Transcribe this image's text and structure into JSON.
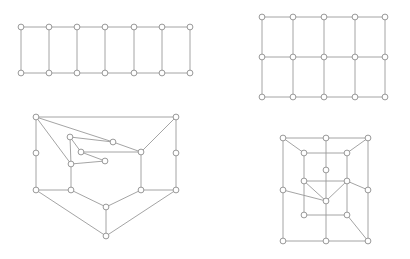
{
  "figure": {
    "background_color": "#ffffff",
    "edge_color": "#9a9a9a",
    "node_stroke_color": "#8d8d8d",
    "node_fill_color": "#ffffff",
    "node_radius": 2.9,
    "edge_width": 0.9,
    "width": 410,
    "height": 259,
    "panels": [
      {
        "id": "top-left",
        "name": "ladder-graph",
        "label": "Ladder graph P7 x K2",
        "node_count": 14,
        "edge_count": 19,
        "nodes": [
          {
            "id": 0,
            "x": 21,
            "y": 27
          },
          {
            "id": 1,
            "x": 49,
            "y": 27
          },
          {
            "id": 2,
            "x": 77,
            "y": 27
          },
          {
            "id": 3,
            "x": 105,
            "y": 27
          },
          {
            "id": 4,
            "x": 134,
            "y": 27
          },
          {
            "id": 5,
            "x": 162,
            "y": 27
          },
          {
            "id": 6,
            "x": 190,
            "y": 27
          },
          {
            "id": 7,
            "x": 21,
            "y": 73
          },
          {
            "id": 8,
            "x": 49,
            "y": 73
          },
          {
            "id": 9,
            "x": 77,
            "y": 73
          },
          {
            "id": 10,
            "x": 105,
            "y": 73
          },
          {
            "id": 11,
            "x": 134,
            "y": 73
          },
          {
            "id": 12,
            "x": 162,
            "y": 73
          },
          {
            "id": 13,
            "x": 190,
            "y": 73
          }
        ],
        "edges": [
          [
            0,
            1
          ],
          [
            1,
            2
          ],
          [
            2,
            3
          ],
          [
            3,
            4
          ],
          [
            4,
            5
          ],
          [
            5,
            6
          ],
          [
            7,
            8
          ],
          [
            8,
            9
          ],
          [
            9,
            10
          ],
          [
            10,
            11
          ],
          [
            11,
            12
          ],
          [
            12,
            13
          ],
          [
            0,
            7
          ],
          [
            1,
            8
          ],
          [
            2,
            9
          ],
          [
            3,
            10
          ],
          [
            4,
            11
          ],
          [
            5,
            12
          ],
          [
            6,
            13
          ]
        ]
      },
      {
        "id": "top-right",
        "name": "grid-graph",
        "label": "Grid graph P5 x P3",
        "node_count": 15,
        "edge_count": 22,
        "nodes": [
          {
            "id": 0,
            "x": 262,
            "y": 17
          },
          {
            "id": 1,
            "x": 293,
            "y": 17
          },
          {
            "id": 2,
            "x": 324,
            "y": 17
          },
          {
            "id": 3,
            "x": 355,
            "y": 17
          },
          {
            "id": 4,
            "x": 385,
            "y": 17
          },
          {
            "id": 5,
            "x": 262,
            "y": 57
          },
          {
            "id": 6,
            "x": 293,
            "y": 57
          },
          {
            "id": 7,
            "x": 324,
            "y": 57
          },
          {
            "id": 8,
            "x": 355,
            "y": 57
          },
          {
            "id": 9,
            "x": 385,
            "y": 57
          },
          {
            "id": 10,
            "x": 262,
            "y": 97
          },
          {
            "id": 11,
            "x": 293,
            "y": 97
          },
          {
            "id": 12,
            "x": 324,
            "y": 97
          },
          {
            "id": 13,
            "x": 355,
            "y": 97
          },
          {
            "id": 14,
            "x": 385,
            "y": 97
          }
        ],
        "edges": [
          [
            0,
            1
          ],
          [
            1,
            2
          ],
          [
            2,
            3
          ],
          [
            3,
            4
          ],
          [
            5,
            6
          ],
          [
            6,
            7
          ],
          [
            7,
            8
          ],
          [
            8,
            9
          ],
          [
            10,
            11
          ],
          [
            11,
            12
          ],
          [
            12,
            13
          ],
          [
            13,
            14
          ],
          [
            0,
            5
          ],
          [
            5,
            10
          ],
          [
            1,
            6
          ],
          [
            6,
            11
          ],
          [
            2,
            7
          ],
          [
            7,
            12
          ],
          [
            3,
            8
          ],
          [
            8,
            13
          ],
          [
            4,
            9
          ],
          [
            9,
            14
          ]
        ]
      },
      {
        "id": "bottom-left",
        "name": "planar-cubic-graph",
        "label": "Planar cubic graph drawing",
        "node_count": 16,
        "edge_count": 24,
        "nodes": [
          {
            "id": 0,
            "x": 36,
            "y": 117
          },
          {
            "id": 1,
            "x": 176,
            "y": 117
          },
          {
            "id": 2,
            "x": 70,
            "y": 137
          },
          {
            "id": 3,
            "x": 113,
            "y": 142
          },
          {
            "id": 4,
            "x": 81,
            "y": 152
          },
          {
            "id": 5,
            "x": 141,
            "y": 152
          },
          {
            "id": 6,
            "x": 71,
            "y": 164
          },
          {
            "id": 7,
            "x": 105,
            "y": 161
          },
          {
            "id": 8,
            "x": 36,
            "y": 190
          },
          {
            "id": 9,
            "x": 71,
            "y": 190
          },
          {
            "id": 10,
            "x": 141,
            "y": 190
          },
          {
            "id": 11,
            "x": 176,
            "y": 190
          },
          {
            "id": 12,
            "x": 106,
            "y": 207
          },
          {
            "id": 13,
            "x": 106,
            "y": 236
          },
          {
            "id": 14,
            "x": 36,
            "y": 153
          },
          {
            "id": 15,
            "x": 176,
            "y": 153
          }
        ],
        "edges": [
          [
            0,
            1
          ],
          [
            0,
            14
          ],
          [
            14,
            8
          ],
          [
            1,
            15
          ],
          [
            15,
            11
          ],
          [
            0,
            6
          ],
          [
            1,
            5
          ],
          [
            0,
            3
          ],
          [
            2,
            3
          ],
          [
            2,
            4
          ],
          [
            3,
            5
          ],
          [
            4,
            7
          ],
          [
            6,
            7
          ],
          [
            6,
            2
          ],
          [
            4,
            5
          ],
          [
            6,
            9
          ],
          [
            5,
            10
          ],
          [
            8,
            9
          ],
          [
            8,
            13
          ],
          [
            9,
            12
          ],
          [
            10,
            11
          ],
          [
            10,
            12
          ],
          [
            11,
            13
          ],
          [
            12,
            13
          ]
        ]
      },
      {
        "id": "bottom-right",
        "name": "nested-grid-graph",
        "label": "Nested grid graph drawing",
        "node_count": 16,
        "edge_count": 24,
        "nodes": [
          {
            "id": 0,
            "x": 283,
            "y": 138
          },
          {
            "id": 1,
            "x": 326,
            "y": 138
          },
          {
            "id": 2,
            "x": 368,
            "y": 138
          },
          {
            "id": 3,
            "x": 304,
            "y": 153
          },
          {
            "id": 4,
            "x": 347,
            "y": 153
          },
          {
            "id": 5,
            "x": 283,
            "y": 190
          },
          {
            "id": 6,
            "x": 304,
            "y": 181
          },
          {
            "id": 7,
            "x": 347,
            "y": 181
          },
          {
            "id": 8,
            "x": 368,
            "y": 190
          },
          {
            "id": 9,
            "x": 326,
            "y": 201
          },
          {
            "id": 10,
            "x": 304,
            "y": 215
          },
          {
            "id": 11,
            "x": 347,
            "y": 215
          },
          {
            "id": 12,
            "x": 283,
            "y": 241
          },
          {
            "id": 13,
            "x": 326,
            "y": 241
          },
          {
            "id": 14,
            "x": 368,
            "y": 241
          },
          {
            "id": 15,
            "x": 326,
            "y": 170
          }
        ],
        "edges": [
          [
            0,
            1
          ],
          [
            1,
            2
          ],
          [
            0,
            5
          ],
          [
            5,
            12
          ],
          [
            2,
            8
          ],
          [
            8,
            14
          ],
          [
            12,
            13
          ],
          [
            13,
            14
          ],
          [
            3,
            4
          ],
          [
            4,
            2
          ],
          [
            3,
            6
          ],
          [
            4,
            7
          ],
          [
            6,
            7
          ],
          [
            7,
            8
          ],
          [
            1,
            9
          ],
          [
            6,
            9
          ],
          [
            9,
            7
          ],
          [
            5,
            9
          ],
          [
            10,
            11
          ],
          [
            6,
            10
          ],
          [
            7,
            11
          ],
          [
            9,
            13
          ],
          [
            11,
            14
          ],
          [
            0,
            3
          ]
        ]
      }
    ]
  }
}
